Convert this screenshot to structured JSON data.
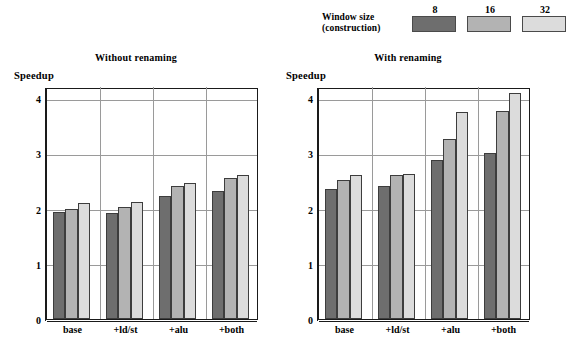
{
  "legend": {
    "title_line1": "Window size",
    "title_line2": "(construction)",
    "entries": [
      {
        "key": "8",
        "color": "#6e6e6e"
      },
      {
        "key": "16",
        "color": "#b3b3b3"
      },
      {
        "key": "32",
        "color": "#dcdcdc"
      }
    ]
  },
  "chart_data": [
    {
      "type": "bar",
      "title": "Without renaming",
      "xlabel": "",
      "ylabel": "Speedup",
      "categories": [
        "base",
        "+ld/st",
        "+alu",
        "+both"
      ],
      "series": [
        {
          "name": "8",
          "color": "#6e6e6e",
          "values": [
            1.93,
            1.92,
            2.22,
            2.32
          ]
        },
        {
          "name": "16",
          "color": "#b3b3b3",
          "values": [
            2.0,
            2.03,
            2.4,
            2.55
          ]
        },
        {
          "name": "32",
          "color": "#dcdcdc",
          "values": [
            2.1,
            2.12,
            2.47,
            2.6
          ]
        }
      ],
      "yticks": [
        0,
        1,
        2,
        3,
        4
      ],
      "ylim": [
        0,
        4.2
      ],
      "grid": true,
      "legend_position": "top"
    },
    {
      "type": "bar",
      "title": "With renaming",
      "xlabel": "",
      "ylabel": "Speedup",
      "categories": [
        "base",
        "+ld/st",
        "+alu",
        "+both"
      ],
      "series": [
        {
          "name": "8",
          "color": "#6e6e6e",
          "values": [
            2.35,
            2.4,
            2.87,
            3.0
          ]
        },
        {
          "name": "16",
          "color": "#b3b3b3",
          "values": [
            2.52,
            2.6,
            3.25,
            3.77
          ]
        },
        {
          "name": "32",
          "color": "#dcdcdc",
          "values": [
            2.6,
            2.63,
            3.75,
            4.1
          ]
        }
      ],
      "yticks": [
        0,
        1,
        2,
        3,
        4
      ],
      "ylim": [
        0,
        4.2
      ],
      "grid": true,
      "legend_position": "top"
    }
  ]
}
